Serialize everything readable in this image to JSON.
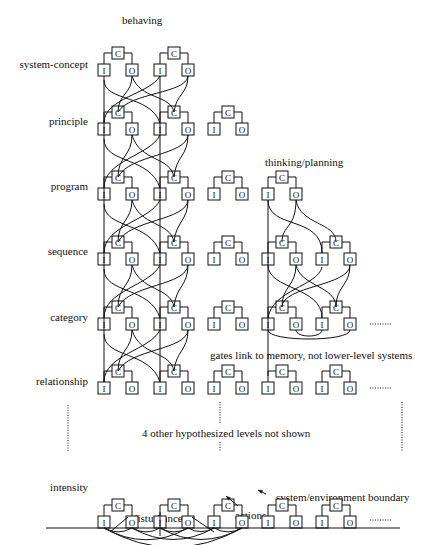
{
  "diagram": {
    "title_behaving": "behaving",
    "title_thinking": "thinking/planning",
    "levels": [
      {
        "name": "system-concept",
        "y": 70
      },
      {
        "name": "principle",
        "y": 129
      },
      {
        "name": "program",
        "y": 194
      },
      {
        "name": "sequence",
        "y": 259
      },
      {
        "name": "category",
        "y": 324
      },
      {
        "name": "relationship",
        "y": 388
      },
      {
        "name": "intensity",
        "y": 522
      }
    ],
    "annotations": {
      "gates": "gates link to memory, not lower-level systems",
      "hidden_levels": "4 other hypothesized levels not shown",
      "boundary": "system/environment boundary",
      "disturbances": "disturbances",
      "actions": "actions"
    },
    "box_labels": {
      "comparator": "C",
      "input": "I",
      "output": "O"
    },
    "colors": {
      "line": "#111111",
      "background": "#ffffff"
    }
  }
}
